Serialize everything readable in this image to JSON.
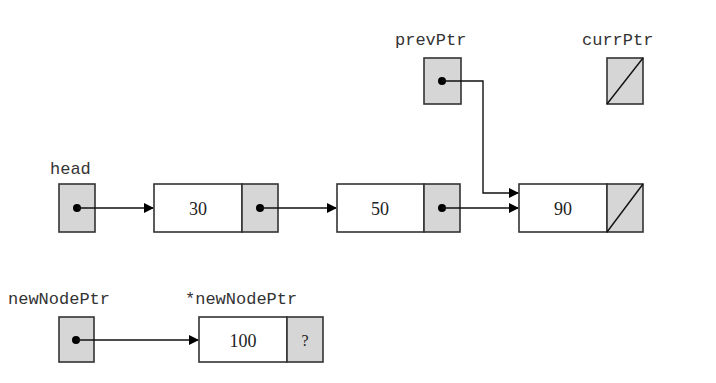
{
  "diagram": {
    "type": "linked-list",
    "colors": {
      "pointer_fill": "#d6d6d6",
      "stroke": "#333333",
      "node_fill": "#ffffff"
    },
    "labels": {
      "head": "head",
      "prevPtr": "prevPtr",
      "currPtr": "currPtr",
      "newNodePtr": "newNodePtr",
      "newNodeDeref": "*newNodePtr"
    },
    "list_nodes": [
      {
        "value": "30",
        "next": "pointer"
      },
      {
        "value": "50",
        "next": "pointer"
      },
      {
        "value": "90",
        "next": "null"
      }
    ],
    "new_node": {
      "value": "100",
      "next": "?"
    },
    "pointers": {
      "head": "points to node 30",
      "prevPtr": "points to node 90",
      "currPtr": "null",
      "newNodePtr": "points to new node 100"
    }
  }
}
